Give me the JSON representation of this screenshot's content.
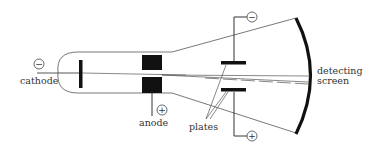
{
  "labels": {
    "cathode": "cathode",
    "anode": "anode",
    "plates": "plates",
    "screen_line1": "detecting",
    "screen_line2": "screen"
  },
  "symbols": {
    "cathode_polarity": "−",
    "anode_polarity": "+",
    "top_plate_polarity": "−",
    "bottom_plate_polarity": "+"
  },
  "colors": {
    "line": "#444444",
    "solid": "#111111",
    "text": "#333333",
    "background": "#ffffff"
  }
}
